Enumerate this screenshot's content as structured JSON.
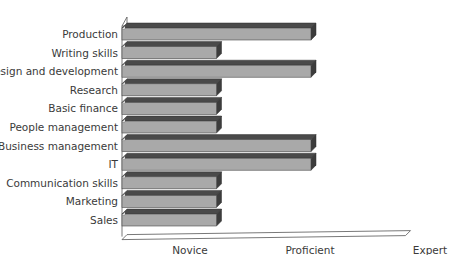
{
  "chart_data": {
    "type": "bar",
    "orientation": "horizontal",
    "style": "3d",
    "title": "",
    "xlabel": "",
    "ylabel": "",
    "categories": [
      "Production",
      "Writing skills",
      "Design and development",
      "Research",
      "Basic finance",
      "People management",
      "Business management",
      "IT",
      "Communication skills",
      "Marketing",
      "Sales"
    ],
    "values": [
      2,
      1,
      2,
      1,
      1,
      1,
      2,
      2,
      1,
      1,
      1
    ],
    "tick_labels": [
      "Novice",
      "Proficient",
      "Expert"
    ],
    "tick_values": [
      1,
      2,
      3
    ],
    "xlim": [
      0,
      3
    ],
    "grid": false,
    "legend": null,
    "colors": {
      "bar_front": "#a9a9a9",
      "bar_top": "#4a4a4a",
      "bar_side": "#3c3c3c",
      "axis": "#555555"
    }
  }
}
